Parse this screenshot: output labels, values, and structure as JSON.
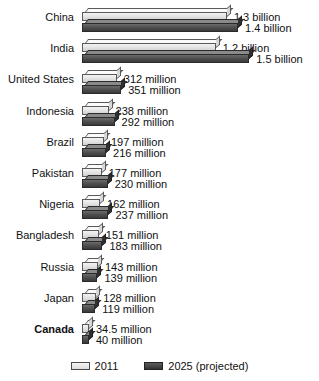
{
  "chart_data": {
    "type": "bar",
    "orientation": "horizontal",
    "title": "",
    "xlabel": "",
    "ylabel": "",
    "grid": false,
    "legend_position": "bottom",
    "categories": [
      "China",
      "India",
      "United States",
      "Indonesia",
      "Brazil",
      "Pakistan",
      "Nigeria",
      "Bangladesh",
      "Russia",
      "Japan",
      "Canada"
    ],
    "series": [
      {
        "name": "2011",
        "color": "#e2e2e2",
        "values": [
          1300,
          1200,
          312,
          238,
          197,
          177,
          162,
          151,
          143,
          128,
          34.5
        ],
        "labels": [
          "1.3 billion",
          "1.2 billion",
          "312 million",
          "238 million",
          "197 million",
          "177 million",
          "162 million",
          "151 million",
          "143 million",
          "128 million",
          "34.5 million"
        ]
      },
      {
        "name": "2025 (projected)",
        "color": "#4c4c4c",
        "values": [
          1400,
          1500,
          351,
          292,
          216,
          230,
          237,
          183,
          139,
          119,
          40
        ],
        "labels": [
          "1.4 billion",
          "1.5 billion",
          "351 million",
          "292 million",
          "216 million",
          "230 million",
          "237 million",
          "183 million",
          "139 million",
          "119 million",
          "40 million"
        ]
      }
    ],
    "units": "millions of people",
    "xlim": [
      0,
      1500
    ]
  },
  "rows": [
    {
      "label": "China",
      "bold": false,
      "v2011": 1300,
      "v2025": 1400,
      "l2011": "1.3 billion",
      "l2025": "1.4 billion"
    },
    {
      "label": "India",
      "bold": false,
      "v2011": 1200,
      "v2025": 1500,
      "l2011": "1.2 billion",
      "l2025": "1.5 billion"
    },
    {
      "label": "United States",
      "bold": false,
      "v2011": 312,
      "v2025": 351,
      "l2011": "312 million",
      "l2025": "351 million"
    },
    {
      "label": "Indonesia",
      "bold": false,
      "v2011": 238,
      "v2025": 292,
      "l2011": "238 million",
      "l2025": "292 million"
    },
    {
      "label": "Brazil",
      "bold": false,
      "v2011": 197,
      "v2025": 216,
      "l2011": "197 million",
      "l2025": "216 million"
    },
    {
      "label": "Pakistan",
      "bold": false,
      "v2011": 177,
      "v2025": 230,
      "l2011": "177 million",
      "l2025": "230 million"
    },
    {
      "label": "Nigeria",
      "bold": false,
      "v2011": 162,
      "v2025": 237,
      "l2011": "162 million",
      "l2025": "237 million"
    },
    {
      "label": "Bangladesh",
      "bold": false,
      "v2011": 151,
      "v2025": 183,
      "l2011": "151 million",
      "l2025": "183 million"
    },
    {
      "label": "Russia",
      "bold": false,
      "v2011": 143,
      "v2025": 139,
      "l2011": "143 million",
      "l2025": "139 million"
    },
    {
      "label": "Japan",
      "bold": false,
      "v2011": 128,
      "v2025": 119,
      "l2011": "128 million",
      "l2025": "119 million"
    },
    {
      "label": "Canada",
      "bold": true,
      "v2011": 34.5,
      "v2025": 40,
      "l2011": "34.5 million",
      "l2025": "40 million"
    }
  ],
  "legend": {
    "items": [
      {
        "label": "2011",
        "swatch": "light"
      },
      {
        "label": "2025 (projected)",
        "swatch": "dark"
      }
    ]
  }
}
